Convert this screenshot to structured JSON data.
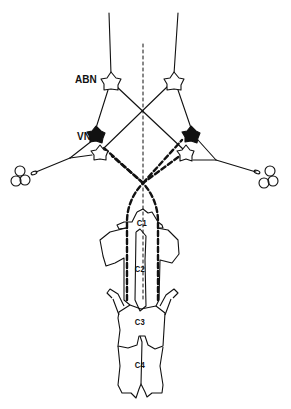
{
  "figure": {
    "type": "neuroanatomical line diagram",
    "labels": {
      "abn": "ABN",
      "vn": "VN"
    },
    "vertebrae": [
      {
        "label": "C1"
      },
      {
        "label": "C2"
      },
      {
        "label": "C3"
      },
      {
        "label": "C4"
      }
    ],
    "elements": {
      "neurons": [
        {
          "name": "left-abn-neuron",
          "fill": "open"
        },
        {
          "name": "right-abn-neuron",
          "fill": "open"
        },
        {
          "name": "left-vn-neuron",
          "fill": "filled"
        },
        {
          "name": "right-vn-neuron",
          "fill": "filled"
        },
        {
          "name": "left-lower-neuron",
          "fill": "open"
        },
        {
          "name": "right-lower-neuron",
          "fill": "open"
        }
      ],
      "midline": "dashed vertical",
      "crossing_pathways": "dashed ascending fibers crossing at midline",
      "receptors": [
        "left-labyrinth",
        "right-labyrinth"
      ]
    },
    "colors": {
      "ink": "#111111",
      "background": "#ffffff"
    }
  }
}
